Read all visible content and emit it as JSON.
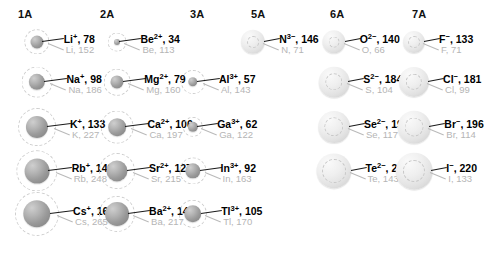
{
  "figure": {
    "type": "ionic-radii-periodic-chart",
    "units": "pm",
    "note_ion_label_format": "symbol charge, ionic radius",
    "note_atom_label_format": "symbol, atomic radius"
  },
  "columns": [
    {
      "id": "1A",
      "label": "1A",
      "header_x": 18,
      "center_x": 37
    },
    {
      "id": "2A",
      "label": "2A",
      "header_x": 100,
      "center_x": 117
    },
    {
      "id": "3A",
      "label": "3A",
      "header_x": 190,
      "center_x": 193
    },
    {
      "id": "5A",
      "label": "5A",
      "header_x": 251,
      "center_x": 253
    },
    {
      "id": "6A",
      "label": "6A",
      "header_x": 330,
      "center_x": 334
    },
    {
      "id": "7A",
      "label": "7A",
      "header_x": 412,
      "center_x": 414
    }
  ],
  "rows": [
    {
      "index": 1,
      "center_y": 42
    },
    {
      "index": 2,
      "center_y": 82
    },
    {
      "index": 3,
      "center_y": 127
    },
    {
      "index": 4,
      "center_y": 171
    },
    {
      "index": 5,
      "center_y": 214
    }
  ],
  "entries": [
    {
      "key": "li",
      "column": "1A",
      "row": 1,
      "kind": "cation",
      "ion_symbol": "Li",
      "ion_charge": "+",
      "ion_radius": 78,
      "atom_symbol": "Li",
      "atom_radius": 152,
      "ion_label": "Li+, 78",
      "atom_label": "Li, 152"
    },
    {
      "key": "na",
      "column": "1A",
      "row": 2,
      "kind": "cation",
      "ion_symbol": "Na",
      "ion_charge": "+",
      "ion_radius": 98,
      "atom_symbol": "Na",
      "atom_radius": 186,
      "ion_label": "Na+, 98",
      "atom_label": "Na, 186"
    },
    {
      "key": "k",
      "column": "1A",
      "row": 3,
      "kind": "cation",
      "ion_symbol": "K",
      "ion_charge": "+",
      "ion_radius": 133,
      "atom_symbol": "K",
      "atom_radius": 227,
      "ion_label": "K+, 133",
      "atom_label": "K, 227"
    },
    {
      "key": "rb",
      "column": "1A",
      "row": 4,
      "kind": "cation",
      "ion_symbol": "Rb",
      "ion_charge": "+",
      "ion_radius": 149,
      "atom_symbol": "Rb",
      "atom_radius": 248,
      "ion_label": "Rb+, 149",
      "atom_label": "Rb, 248"
    },
    {
      "key": "cs",
      "column": "1A",
      "row": 5,
      "kind": "cation",
      "ion_symbol": "Cs",
      "ion_charge": "+",
      "ion_radius": 165,
      "atom_symbol": "Cs",
      "atom_radius": 265,
      "ion_label": "Cs+, 165",
      "atom_label": "Cs, 265"
    },
    {
      "key": "be",
      "column": "2A",
      "row": 1,
      "kind": "cation",
      "ion_symbol": "Be",
      "ion_charge": "2+",
      "ion_radius": 34,
      "atom_symbol": "Be",
      "atom_radius": 113,
      "ion_label": "Be2+, 34",
      "atom_label": "Be, 113"
    },
    {
      "key": "mg",
      "column": "2A",
      "row": 2,
      "kind": "cation",
      "ion_symbol": "Mg",
      "ion_charge": "2+",
      "ion_radius": 79,
      "atom_symbol": "Mg",
      "atom_radius": 160,
      "ion_label": "Mg2+, 79",
      "atom_label": "Mg, 160"
    },
    {
      "key": "ca",
      "column": "2A",
      "row": 3,
      "kind": "cation",
      "ion_symbol": "Ca",
      "ion_charge": "2+",
      "ion_radius": 106,
      "atom_symbol": "Ca",
      "atom_radius": 197,
      "ion_label": "Ca2+, 106",
      "atom_label": "Ca, 197"
    },
    {
      "key": "sr",
      "column": "2A",
      "row": 4,
      "kind": "cation",
      "ion_symbol": "Sr",
      "ion_charge": "2+",
      "ion_radius": 127,
      "atom_symbol": "Sr",
      "atom_radius": 215,
      "ion_label": "Sr2+, 127",
      "atom_label": "Sr, 215"
    },
    {
      "key": "ba",
      "column": "2A",
      "row": 5,
      "kind": "cation",
      "ion_symbol": "Ba",
      "ion_charge": "2+",
      "ion_radius": 143,
      "atom_symbol": "Ba",
      "atom_radius": 217,
      "ion_label": "Ba2+, 143",
      "atom_label": "Ba, 217"
    },
    {
      "key": "al",
      "column": "3A",
      "row": 2,
      "kind": "cation",
      "ion_symbol": "Al",
      "ion_charge": "3+",
      "ion_radius": 57,
      "atom_symbol": "Al",
      "atom_radius": 143,
      "ion_label": "Al3+, 57",
      "atom_label": "Al, 143"
    },
    {
      "key": "ga",
      "column": "3A",
      "row": 3,
      "kind": "cation",
      "ion_symbol": "Ga",
      "ion_charge": "3+",
      "ion_radius": 62,
      "atom_symbol": "Ga",
      "atom_radius": 122,
      "ion_label": "Ga3+, 62",
      "atom_label": "Ga, 122"
    },
    {
      "key": "in",
      "column": "3A",
      "row": 4,
      "kind": "cation",
      "ion_symbol": "In",
      "ion_charge": "3+",
      "ion_radius": 92,
      "atom_symbol": "In",
      "atom_radius": 163,
      "ion_label": "In3+, 92",
      "atom_label": "In, 163"
    },
    {
      "key": "tl",
      "column": "3A",
      "row": 5,
      "kind": "cation",
      "ion_symbol": "Tl",
      "ion_charge": "3+",
      "ion_radius": 105,
      "atom_symbol": "Tl",
      "atom_radius": 170,
      "ion_label": "Tl3+, 105",
      "atom_label": "Tl, 170"
    },
    {
      "key": "n",
      "column": "5A",
      "row": 1,
      "kind": "anion",
      "ion_symbol": "N",
      "ion_charge": "3−",
      "ion_radius": 146,
      "atom_symbol": "N",
      "atom_radius": 71,
      "ion_label": "N3−, 146",
      "atom_label": "N, 71"
    },
    {
      "key": "o",
      "column": "6A",
      "row": 1,
      "kind": "anion",
      "ion_symbol": "O",
      "ion_charge": "2−",
      "ion_radius": 140,
      "atom_symbol": "O",
      "atom_radius": 66,
      "ion_label": "O2−, 140",
      "atom_label": "O, 66"
    },
    {
      "key": "s",
      "column": "6A",
      "row": 2,
      "kind": "anion",
      "ion_symbol": "S",
      "ion_charge": "2−",
      "ion_radius": 184,
      "atom_symbol": "S",
      "atom_radius": 104,
      "ion_label": "S2−, 184",
      "atom_label": "S, 104"
    },
    {
      "key": "se",
      "column": "6A",
      "row": 3,
      "kind": "anion",
      "ion_symbol": "Se",
      "ion_charge": "2−",
      "ion_radius": 191,
      "atom_symbol": "Se",
      "atom_radius": 117,
      "ion_label": "Se2−, 191",
      "atom_label": "Se, 117"
    },
    {
      "key": "te",
      "column": "6A",
      "row": 4,
      "kind": "anion",
      "ion_symbol": "Te",
      "ion_charge": "2−",
      "ion_radius": 211,
      "atom_symbol": "Te",
      "atom_radius": 143,
      "ion_label": "Te2−, 211",
      "atom_label": "Te, 143"
    },
    {
      "key": "f",
      "column": "7A",
      "row": 1,
      "kind": "anion",
      "ion_symbol": "F",
      "ion_charge": "−",
      "ion_radius": 133,
      "atom_symbol": "F",
      "atom_radius": 71,
      "ion_label": "F−, 133",
      "atom_label": "F, 71"
    },
    {
      "key": "cl",
      "column": "7A",
      "row": 2,
      "kind": "anion",
      "ion_symbol": "Cl",
      "ion_charge": "−",
      "ion_radius": 181,
      "atom_symbol": "Cl",
      "atom_radius": 99,
      "ion_label": "Cl−, 181",
      "atom_label": "Cl, 99"
    },
    {
      "key": "br",
      "column": "7A",
      "row": 3,
      "kind": "anion",
      "ion_symbol": "Br",
      "ion_charge": "−",
      "ion_radius": 196,
      "atom_symbol": "Br",
      "atom_radius": 114,
      "ion_label": "Br−, 196",
      "atom_label": "Br, 114"
    },
    {
      "key": "i",
      "column": "7A",
      "row": 4,
      "kind": "anion",
      "ion_symbol": "I",
      "ion_charge": "−",
      "ion_radius": 220,
      "atom_symbol": "I",
      "atom_radius": 133,
      "ion_label": "I−, 220",
      "atom_label": "I, 133"
    }
  ],
  "chart_data": {
    "type": "bar",
    "xlabel": "Periodic group",
    "ylabel": "Radius (pm)",
    "categories": [
      "1A",
      "2A",
      "3A",
      "5A",
      "6A",
      "7A"
    ],
    "series": [
      {
        "name": "Ionic radius (pm)",
        "points": [
          {
            "label": "Li+",
            "value": 78
          },
          {
            "label": "Na+",
            "value": 98
          },
          {
            "label": "K+",
            "value": 133
          },
          {
            "label": "Rb+",
            "value": 149
          },
          {
            "label": "Cs+",
            "value": 165
          },
          {
            "label": "Be2+",
            "value": 34
          },
          {
            "label": "Mg2+",
            "value": 79
          },
          {
            "label": "Ca2+",
            "value": 106
          },
          {
            "label": "Sr2+",
            "value": 127
          },
          {
            "label": "Ba2+",
            "value": 143
          },
          {
            "label": "Al3+",
            "value": 57
          },
          {
            "label": "Ga3+",
            "value": 62
          },
          {
            "label": "In3+",
            "value": 92
          },
          {
            "label": "Tl3+",
            "value": 105
          },
          {
            "label": "N3-",
            "value": 146
          },
          {
            "label": "O2-",
            "value": 140
          },
          {
            "label": "S2-",
            "value": 184
          },
          {
            "label": "Se2-",
            "value": 191
          },
          {
            "label": "Te2-",
            "value": 211
          },
          {
            "label": "F-",
            "value": 133
          },
          {
            "label": "Cl-",
            "value": 181
          },
          {
            "label": "Br-",
            "value": 196
          },
          {
            "label": "I-",
            "value": 220
          }
        ]
      },
      {
        "name": "Atomic radius (pm)",
        "points": [
          {
            "label": "Li",
            "value": 152
          },
          {
            "label": "Na",
            "value": 186
          },
          {
            "label": "K",
            "value": 227
          },
          {
            "label": "Rb",
            "value": 248
          },
          {
            "label": "Cs",
            "value": 265
          },
          {
            "label": "Be",
            "value": 113
          },
          {
            "label": "Mg",
            "value": 160
          },
          {
            "label": "Ca",
            "value": 197
          },
          {
            "label": "Sr",
            "value": 215
          },
          {
            "label": "Ba",
            "value": 217
          },
          {
            "label": "Al",
            "value": 143
          },
          {
            "label": "Ga",
            "value": 122
          },
          {
            "label": "In",
            "value": 163
          },
          {
            "label": "Tl",
            "value": 170
          },
          {
            "label": "N",
            "value": 71
          },
          {
            "label": "O",
            "value": 66
          },
          {
            "label": "S",
            "value": 104
          },
          {
            "label": "Se",
            "value": 117
          },
          {
            "label": "Te",
            "value": 143
          },
          {
            "label": "F",
            "value": 71
          },
          {
            "label": "Cl",
            "value": 99
          },
          {
            "label": "Br",
            "value": 114
          },
          {
            "label": "I",
            "value": 133
          }
        ]
      }
    ],
    "ylim": [
      0,
      265
    ],
    "grid": false,
    "legend": "none"
  }
}
